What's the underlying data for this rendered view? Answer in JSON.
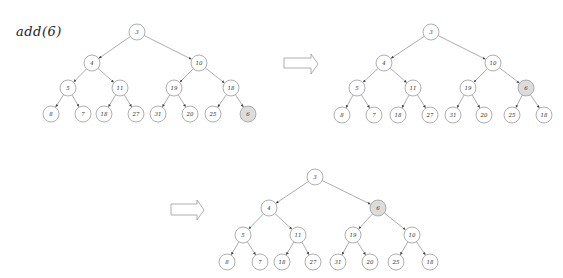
{
  "caption": "add(6)",
  "colors": {
    "node_fill": "#ffffff",
    "node_stroke": "#9a9a9a",
    "highlight_fill": "#dcdcdc",
    "edge": "#8a8a8a",
    "text": "#333333",
    "arrow_stroke": "#9a9a9a"
  },
  "node_radius": 8,
  "trees": [
    {
      "name": "step-1-insert-at-end",
      "nodes": [
        {
          "id": "a",
          "label": "3",
          "x": 137,
          "y": 32
        },
        {
          "id": "b",
          "label": "4",
          "x": 92,
          "y": 63
        },
        {
          "id": "c",
          "label": "10",
          "x": 199,
          "y": 63
        },
        {
          "id": "d",
          "label": "5",
          "x": 68,
          "y": 88
        },
        {
          "id": "e",
          "label": "11",
          "x": 120,
          "y": 88
        },
        {
          "id": "f",
          "label": "19",
          "x": 174,
          "y": 88
        },
        {
          "id": "g",
          "label": "18",
          "x": 231,
          "y": 88
        },
        {
          "id": "h",
          "label": "8",
          "x": 51,
          "y": 114
        },
        {
          "id": "i",
          "label": "7",
          "x": 83,
          "y": 114
        },
        {
          "id": "j",
          "label": "18",
          "x": 104,
          "y": 114
        },
        {
          "id": "k",
          "label": "27",
          "x": 136,
          "y": 114
        },
        {
          "id": "l",
          "label": "31",
          "x": 158,
          "y": 114
        },
        {
          "id": "m",
          "label": "20",
          "x": 190,
          "y": 114
        },
        {
          "id": "n",
          "label": "25",
          "x": 213,
          "y": 114
        },
        {
          "id": "o",
          "label": "6",
          "x": 248,
          "y": 114,
          "highlight": true
        }
      ],
      "edges": [
        [
          "a",
          "b"
        ],
        [
          "a",
          "c"
        ],
        [
          "b",
          "d"
        ],
        [
          "b",
          "e"
        ],
        [
          "c",
          "f"
        ],
        [
          "c",
          "g"
        ],
        [
          "d",
          "h"
        ],
        [
          "d",
          "i"
        ],
        [
          "e",
          "j"
        ],
        [
          "e",
          "k"
        ],
        [
          "f",
          "l"
        ],
        [
          "f",
          "m"
        ],
        [
          "g",
          "n"
        ],
        [
          "g",
          "o"
        ]
      ]
    },
    {
      "name": "step-2-swap-with-18",
      "nodes": [
        {
          "id": "a",
          "label": "3",
          "x": 431,
          "y": 32
        },
        {
          "id": "b",
          "label": "4",
          "x": 384,
          "y": 63
        },
        {
          "id": "c",
          "label": "10",
          "x": 493,
          "y": 63
        },
        {
          "id": "d",
          "label": "5",
          "x": 357,
          "y": 88
        },
        {
          "id": "e",
          "label": "11",
          "x": 413,
          "y": 88
        },
        {
          "id": "f",
          "label": "19",
          "x": 468,
          "y": 88
        },
        {
          "id": "g",
          "label": "6",
          "x": 526,
          "y": 88,
          "highlight": true
        },
        {
          "id": "h",
          "label": "8",
          "x": 342,
          "y": 115
        },
        {
          "id": "i",
          "label": "7",
          "x": 374,
          "y": 115
        },
        {
          "id": "j",
          "label": "18",
          "x": 398,
          "y": 115
        },
        {
          "id": "k",
          "label": "27",
          "x": 430,
          "y": 115
        },
        {
          "id": "l",
          "label": "31",
          "x": 453,
          "y": 115
        },
        {
          "id": "m",
          "label": "20",
          "x": 484,
          "y": 115
        },
        {
          "id": "n",
          "label": "25",
          "x": 512,
          "y": 115
        },
        {
          "id": "o",
          "label": "18",
          "x": 544,
          "y": 115
        }
      ],
      "edges": [
        [
          "a",
          "b"
        ],
        [
          "a",
          "c"
        ],
        [
          "b",
          "d"
        ],
        [
          "b",
          "e"
        ],
        [
          "c",
          "f"
        ],
        [
          "c",
          "g"
        ],
        [
          "d",
          "h"
        ],
        [
          "d",
          "i"
        ],
        [
          "e",
          "j"
        ],
        [
          "e",
          "k"
        ],
        [
          "f",
          "l"
        ],
        [
          "f",
          "m"
        ],
        [
          "g",
          "n"
        ],
        [
          "g",
          "o"
        ]
      ]
    },
    {
      "name": "step-3-swap-with-10",
      "nodes": [
        {
          "id": "a",
          "label": "3",
          "x": 315,
          "y": 177
        },
        {
          "id": "b",
          "label": "4",
          "x": 269,
          "y": 208
        },
        {
          "id": "c",
          "label": "6",
          "x": 378,
          "y": 208,
          "highlight": true
        },
        {
          "id": "d",
          "label": "5",
          "x": 243,
          "y": 235
        },
        {
          "id": "e",
          "label": "11",
          "x": 298,
          "y": 235
        },
        {
          "id": "f",
          "label": "19",
          "x": 353,
          "y": 235
        },
        {
          "id": "g",
          "label": "10",
          "x": 412,
          "y": 235
        },
        {
          "id": "h",
          "label": "8",
          "x": 227,
          "y": 262
        },
        {
          "id": "i",
          "label": "7",
          "x": 260,
          "y": 262
        },
        {
          "id": "j",
          "label": "18",
          "x": 282,
          "y": 262
        },
        {
          "id": "k",
          "label": "27",
          "x": 313,
          "y": 262
        },
        {
          "id": "l",
          "label": "31",
          "x": 338,
          "y": 262
        },
        {
          "id": "m",
          "label": "20",
          "x": 370,
          "y": 262
        },
        {
          "id": "n",
          "label": "25",
          "x": 396,
          "y": 262
        },
        {
          "id": "o",
          "label": "18",
          "x": 430,
          "y": 262
        }
      ],
      "edges": [
        [
          "a",
          "b"
        ],
        [
          "a",
          "c"
        ],
        [
          "b",
          "d"
        ],
        [
          "b",
          "e"
        ],
        [
          "c",
          "f"
        ],
        [
          "c",
          "g"
        ],
        [
          "d",
          "h"
        ],
        [
          "d",
          "i"
        ],
        [
          "e",
          "j"
        ],
        [
          "e",
          "k"
        ],
        [
          "f",
          "l"
        ],
        [
          "f",
          "m"
        ],
        [
          "g",
          "n"
        ],
        [
          "g",
          "o"
        ]
      ]
    }
  ],
  "arrows": [
    {
      "name": "step-arrow-1",
      "x0": 284,
      "x1": 318,
      "head_x": 311,
      "shaft_top": 58,
      "shaft_bottom": 68,
      "head_top": 54,
      "head_bottom": 74
    },
    {
      "name": "step-arrow-2",
      "x0": 171,
      "x1": 204,
      "head_x": 197,
      "shaft_top": 204,
      "shaft_bottom": 215,
      "head_top": 200,
      "head_bottom": 220
    }
  ]
}
